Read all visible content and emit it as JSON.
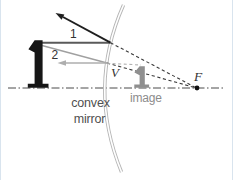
{
  "figure": {
    "type": "ray-diagram-convex-mirror",
    "labels": {
      "ray1": "1",
      "ray2": "2",
      "vertex": "V",
      "focal_point": "F",
      "image": "image",
      "mirror_caption_line1": "convex",
      "mirror_caption_line2": "mirror"
    },
    "colors": {
      "object": "#161616",
      "image_arrow": "#8f8f8f",
      "mirror": "#b5b5b5",
      "mirror_inner": "#ffffff",
      "ray1_incident": "#5a5a5a",
      "ray1_reflected": "#1f1f1f",
      "ray2_incident": "#a0a0a0",
      "ray2_reflected": "#aeaeae",
      "extension_dark": "#3a3a3a",
      "extension_gray": "#b2b2b2",
      "axis": "#4a4a4a",
      "focal_dot": "#111111",
      "label_dark": "#333333",
      "label_gray": "#8c8c8c",
      "caption": "#4f4f4f",
      "page_edge": "#d9e4ee",
      "background": "#ffffff"
    }
  }
}
